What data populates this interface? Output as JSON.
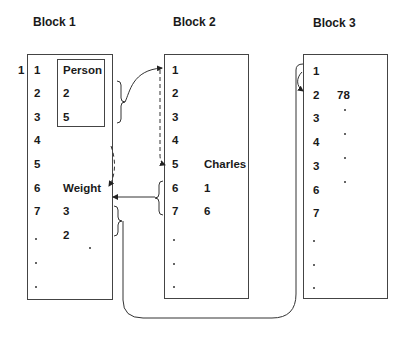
{
  "blocks": [
    {
      "title": "Block 1",
      "outer_label": "1",
      "rows": [
        "1",
        "2",
        "3",
        "4",
        "5",
        "6",
        "7",
        ".",
        ".",
        "."
      ],
      "values": [
        {
          "row": 1,
          "text": "Person"
        },
        {
          "row": 2,
          "text": "2"
        },
        {
          "row": 3,
          "text": "5"
        },
        {
          "row": 6,
          "text": "Weight"
        },
        {
          "row": 7,
          "text": "3"
        },
        {
          "row": 8,
          "text": "2"
        }
      ],
      "inner_box_rows": [
        1,
        3
      ]
    },
    {
      "title": "Block 2",
      "rows": [
        "1",
        "2",
        "3",
        "4",
        "5",
        "6",
        "7",
        ".",
        ".",
        "."
      ],
      "values": [
        {
          "row": 5,
          "text": "Charles"
        },
        {
          "row": 6,
          "text": "1"
        },
        {
          "row": 7,
          "text": "6"
        }
      ]
    },
    {
      "title": "Block 3",
      "rows": [
        "1",
        "2",
        "3",
        "4",
        "3",
        "6",
        "7",
        ".",
        ".",
        "."
      ],
      "values": [
        {
          "row": 2,
          "text": "78"
        }
      ]
    }
  ],
  "connectors": [
    {
      "from": "Block 1 rows 2-3 (brace)",
      "to": "Block 2 row 1",
      "style": "solid arrow"
    },
    {
      "from": "Block 2 row 1",
      "to": "Block 2 row 5",
      "style": "dashed arrow"
    },
    {
      "from": "Block 1 row 4",
      "to": "Block 1 row 6",
      "style": "dashed arrow"
    },
    {
      "from": "Block 2 rows 6-7 (brace)",
      "to": "Block 1 row 6",
      "style": "solid arrow"
    },
    {
      "from": "Block 1 rows 7-8 (brace)",
      "to": "Block 3 rows 1-2",
      "style": "solid line under blocks"
    },
    {
      "from": "Block 3 row 1",
      "to": "Block 3 row 2",
      "style": "curved arrow"
    }
  ]
}
